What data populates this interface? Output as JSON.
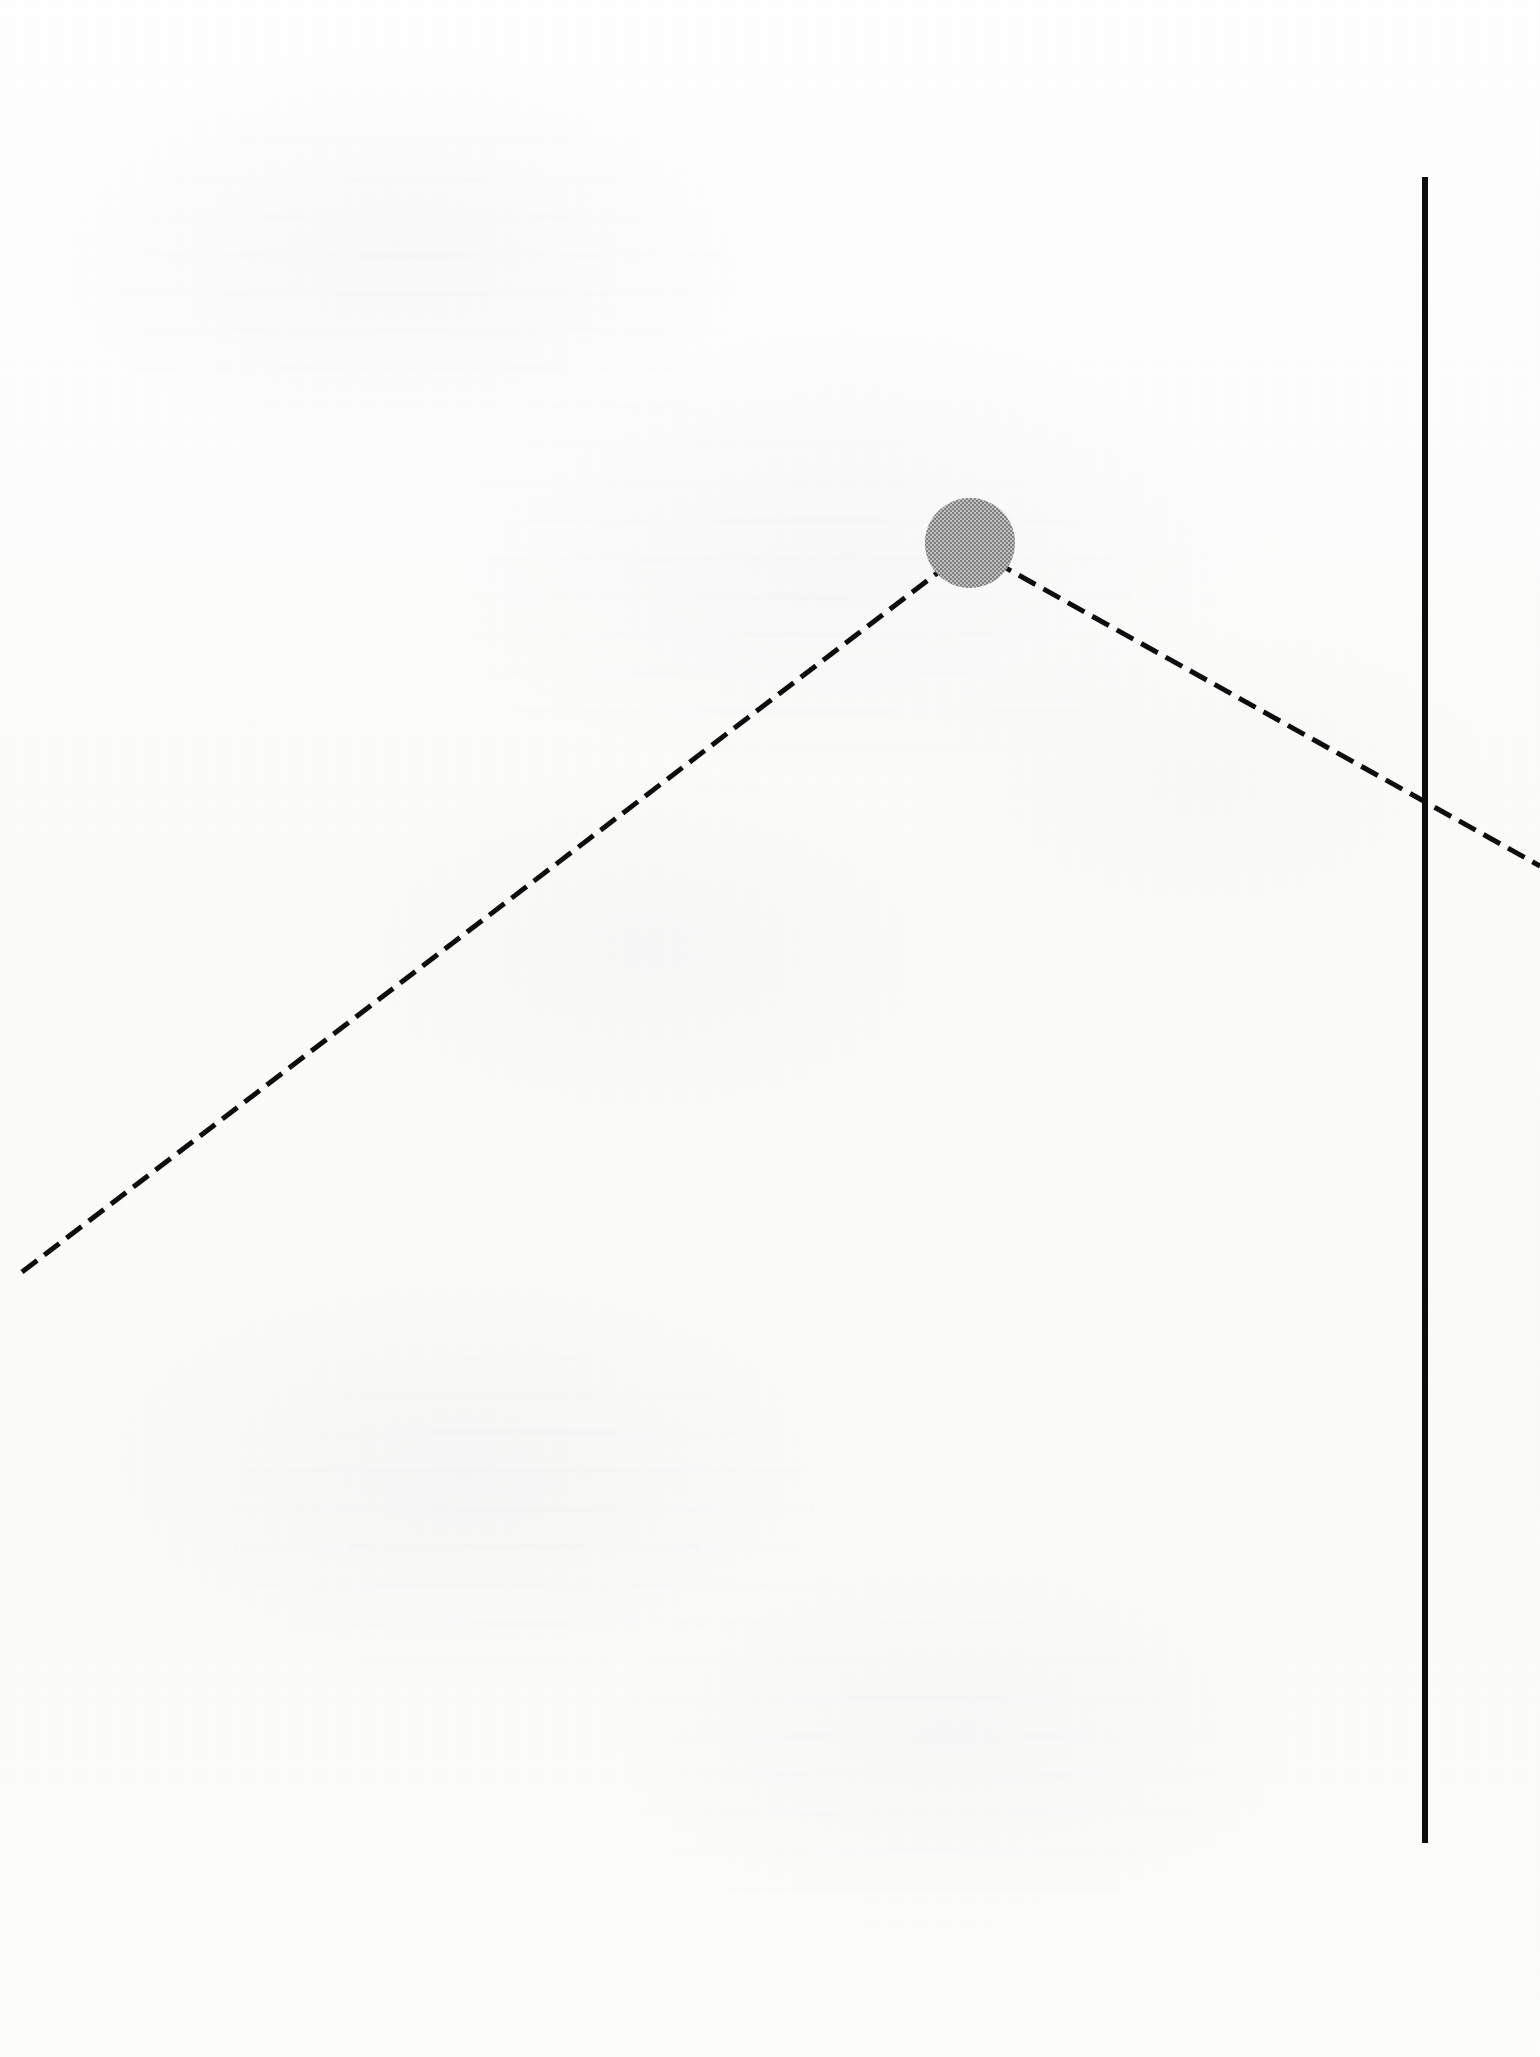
{
  "document": {
    "kind": "scanned-page-figure",
    "page_width": 1540,
    "page_height": 2057,
    "background_color": "#fcfcfb",
    "ink_color": "#111111",
    "marker_fill_color": "#9a9a9a",
    "caption": "",
    "title": ""
  },
  "chart_data": {
    "type": "line",
    "title": "",
    "subtitle": "",
    "xlabel": "",
    "ylabel": "",
    "grid": false,
    "legend_position": "none",
    "axis_ranges": {
      "x_pixels": [
        0,
        1540
      ],
      "y_pixels": [
        0,
        2057
      ]
    },
    "series": [
      {
        "name": "dashed-trend-line",
        "style": "dashed",
        "color": "#111111",
        "line_width_px": 5,
        "dash_px": 19,
        "gap_px": 9,
        "points_px": [
          {
            "x": 22,
            "y": 1272
          },
          {
            "x": 970,
            "y": 548
          },
          {
            "x": 1540,
            "y": 866
          }
        ]
      }
    ],
    "markers": [
      {
        "name": "peak-marker",
        "shape": "circle",
        "fill": "#9a9a9a",
        "halftone": true,
        "center_px": {
          "x": 970,
          "y": 543
        },
        "radius_px": 45,
        "label": ""
      }
    ],
    "reference_lines": [
      {
        "name": "vertical-reference-line",
        "orientation": "vertical",
        "style": "solid",
        "color": "#0d0d0d",
        "line_width_px": 6,
        "x_px": 1425,
        "y_start_px": 177,
        "y_end_px": 1843,
        "label": ""
      }
    ],
    "annotations": [],
    "tick_labels": {
      "x": [],
      "y": []
    }
  },
  "accessibility": {
    "figure_description": "Scanned page showing a dashed line rising from the lower left to a peak marked by a solid gray circle, then falling to the lower right, crossing a tall solid vertical line near the right edge."
  }
}
